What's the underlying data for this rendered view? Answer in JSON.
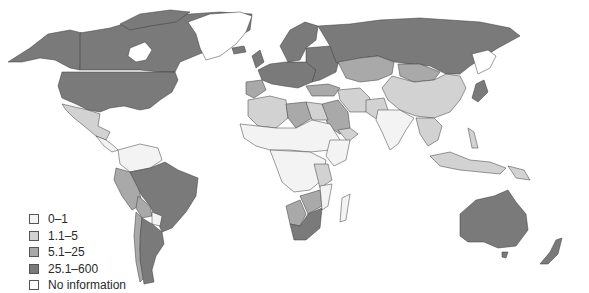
{
  "map": {
    "type": "choropleth",
    "region": "World",
    "fills": {
      "class_0": "#f3f3f3",
      "class_1": "#d2d2d2",
      "class_2": "#a9a9a9",
      "class_3": "#7a7a7a",
      "no_info": "#ffffff"
    }
  },
  "legend": {
    "items": [
      {
        "label": "0–1",
        "color": "#f3f3f3"
      },
      {
        "label": "1.1–5",
        "color": "#d2d2d2"
      },
      {
        "label": "5.1–25",
        "color": "#a9a9a9"
      },
      {
        "label": "25.1–600",
        "color": "#7a7a7a"
      },
      {
        "label": "No information",
        "color": "#ffffff"
      }
    ]
  }
}
